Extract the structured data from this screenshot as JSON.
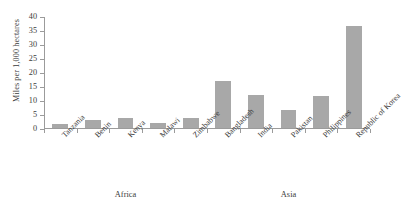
{
  "chart_data": {
    "type": "bar",
    "title": "",
    "subtitle": "",
    "xlabel": "",
    "ylabel": "Miles per 1,000 hectares",
    "ylim": [
      0,
      40
    ],
    "yticks": [
      0,
      5,
      10,
      15,
      20,
      25,
      30,
      35,
      40
    ],
    "ytick_labels": [
      "0",
      "5",
      "10",
      "15",
      "20",
      "25",
      "30",
      "35",
      "40"
    ],
    "grid": false,
    "legend": false,
    "bar_color": "#a8a8a8",
    "axis_color": "#9b9b9b",
    "categories": [
      "Tanzania",
      "Benin",
      "Kenya",
      "Malawi",
      "Zimbabwe",
      "Bangladesh",
      "India",
      "Pakistan",
      "Philippines",
      "Republic of Korea"
    ],
    "values": [
      1.4,
      2.9,
      3.6,
      1.8,
      3.6,
      16.7,
      11.9,
      6.5,
      11.4,
      36.3
    ],
    "groups": [
      {
        "label": "Africa",
        "categories": [
          "Tanzania",
          "Benin",
          "Kenya",
          "Malawi",
          "Zimbabwe"
        ]
      },
      {
        "label": "Asia",
        "categories": [
          "Bangladesh",
          "India",
          "Pakistan",
          "Philippines",
          "Republic of Korea"
        ]
      }
    ]
  }
}
